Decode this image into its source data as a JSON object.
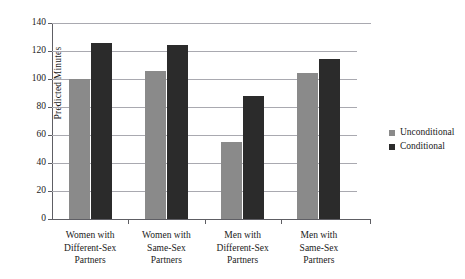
{
  "chart_data": {
    "type": "bar",
    "title": "",
    "subtitle": "",
    "xlabel": "",
    "ylabel": "Predicted Minutes",
    "categories": [
      "Women with\nDifferent-Sex\nPartners",
      "Women with\nSame-Sex\nPartners",
      "Men with\nDifferent-Sex\nPartners",
      "Men with\nSame-Sex\nPartners"
    ],
    "series": [
      {
        "name": "Unconditional",
        "color": "#8a8a8a",
        "values": [
          100,
          106,
          55,
          104
        ]
      },
      {
        "name": "Conditional",
        "color": "#2b2b2b",
        "values": [
          126,
          124,
          88,
          114
        ]
      }
    ],
    "ylim": [
      0,
      140
    ],
    "ytick_step": 20,
    "ytick_labels": [
      "140",
      "120",
      "100",
      "80",
      "60",
      "40",
      "20",
      "0"
    ],
    "ytick_values": [
      140,
      120,
      100,
      80,
      60,
      40,
      20,
      0
    ],
    "grid": true,
    "grid_axis": "y",
    "legend_position": "right",
    "background": "#ffffff"
  },
  "legend": {
    "items": [
      {
        "label": "Unconditional",
        "swatch": "s0"
      },
      {
        "label": "Conditional",
        "swatch": "s1"
      }
    ]
  }
}
